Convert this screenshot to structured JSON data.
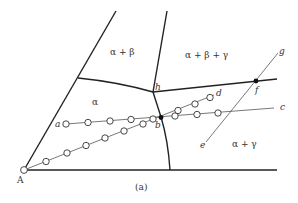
{
  "figure": {
    "caption": "(a)",
    "vertex_label": "A",
    "regions": {
      "alpha": "α",
      "alpha_beta": "α + β",
      "alpha_beta_gamma": "α + β + γ",
      "alpha_gamma": "α + γ"
    },
    "points": {
      "a": "a",
      "b": "b",
      "c": "c",
      "d": "d",
      "e": "e",
      "f": "f",
      "g": "g",
      "h": "h"
    },
    "colors": {
      "line": "#222222",
      "thin_line": "#666666",
      "background": "#ffffff"
    }
  }
}
